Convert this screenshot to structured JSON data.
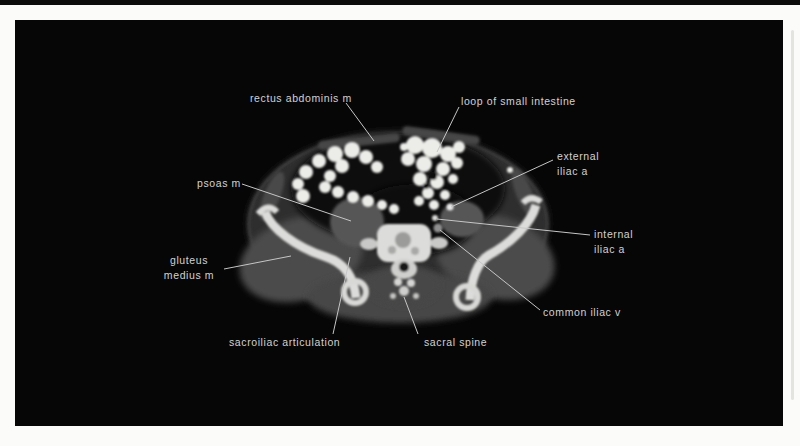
{
  "figure": {
    "plate_color": "#060606",
    "label_color": "#d2d2d2",
    "leader_line_color": "#c6c6c6",
    "page_background": "#fbfbf9",
    "labels": {
      "rectus_abdominis": "rectus abdominis m",
      "loop_small_intestine": "loop of small intestine",
      "psoas": "psoas m",
      "external_iliac": "external iliac a",
      "internal_iliac": "internal iliac a",
      "common_iliac_vein": "common iliac v",
      "gluteus_medius": "gluteus medius m",
      "sacroiliac": "sacroiliac articulation",
      "sacral_spine": "sacral spine"
    }
  }
}
